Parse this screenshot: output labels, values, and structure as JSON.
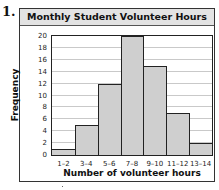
{
  "problem_number": "1.",
  "chart_data": {
    "type": "bar",
    "subtype": "histogram",
    "title": "Monthly Student Volunteer Hours",
    "xlabel": "Number of volunteer hours",
    "ylabel": "Frequency",
    "categories": [
      "1–2",
      "3–4",
      "5–6",
      "7–8",
      "9–10",
      "11–12",
      "13–14"
    ],
    "values": [
      1,
      5,
      12,
      20,
      15,
      7,
      2
    ],
    "ylim": [
      0,
      20
    ],
    "yticks": [
      0,
      2,
      4,
      6,
      8,
      10,
      12,
      14,
      16,
      18,
      20
    ],
    "grid": true,
    "legend": null,
    "bar_color": "#cfcfcf",
    "title_bar_color": "#e3e3e3"
  }
}
